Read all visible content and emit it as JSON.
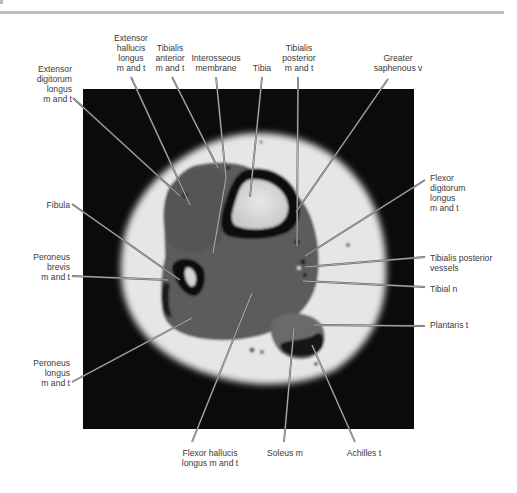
{
  "figure": {
    "type": "axial MRI cross-section of the lower leg (T1-weighted) with anatomical labels",
    "labels": [
      {
        "id": "extensor-digitorum-longus",
        "text": "Extensor\ndigitorum\nlongus\nm and t",
        "x": 72,
        "y": 64,
        "align": "r"
      },
      {
        "id": "extensor-hallucis-longus",
        "text": "Extensor\nhallucis\nlongus\nm and t",
        "x": 131,
        "y": 33,
        "align": "c"
      },
      {
        "id": "tibialis-anterior",
        "text": "Tibialis\nanterior\nm and t",
        "x": 170,
        "y": 43,
        "align": "c"
      },
      {
        "id": "interosseous-membrane",
        "text": "Interosseous\nmembrane",
        "x": 216,
        "y": 53,
        "align": "c"
      },
      {
        "id": "tibia",
        "text": "Tibia",
        "x": 262,
        "y": 63,
        "align": "c"
      },
      {
        "id": "tibialis-posterior",
        "text": "Tibialis\nposterior\nm and t",
        "x": 299,
        "y": 43,
        "align": "c"
      },
      {
        "id": "greater-saphenous-v",
        "text": "Greater\nsaphenous v",
        "x": 398,
        "y": 53,
        "align": "c"
      },
      {
        "id": "flexor-digitorum-longus",
        "text": "Flexor\ndigitorum\nlongus\nm and t",
        "x": 430,
        "y": 173,
        "align": "l"
      },
      {
        "id": "fibula",
        "text": "Fibula",
        "x": 70,
        "y": 200,
        "align": "r"
      },
      {
        "id": "tibialis-posterior-vessels",
        "text": "Tibialis posterior\nvessels",
        "x": 430,
        "y": 253,
        "align": "l"
      },
      {
        "id": "peroneus-brevis",
        "text": "Peroneus\nbrevis\nm and t",
        "x": 70,
        "y": 252,
        "align": "r"
      },
      {
        "id": "tibial-n",
        "text": "Tibial n",
        "x": 430,
        "y": 284,
        "align": "l"
      },
      {
        "id": "plantaris-t",
        "text": "Plantaris t",
        "x": 430,
        "y": 320,
        "align": "l"
      },
      {
        "id": "peroneus-longus",
        "text": "Peroneus\nlongus\nm and t",
        "x": 70,
        "y": 358,
        "align": "r"
      },
      {
        "id": "flexor-hallucis-longus",
        "text": "Flexor hallucis\nlongus m and t",
        "x": 210,
        "y": 448,
        "align": "c"
      },
      {
        "id": "soleus-m",
        "text": "Soleus m",
        "x": 285,
        "y": 448,
        "align": "c"
      },
      {
        "id": "achilles-t",
        "text": "Achilles t",
        "x": 364,
        "y": 448,
        "align": "c"
      }
    ],
    "leaders": [
      {
        "id": "extensor-digitorum-longus",
        "x1": 73,
        "y1": 98,
        "x2": 180,
        "y2": 196
      },
      {
        "id": "extensor-hallucis-longus",
        "x1": 131,
        "y1": 77,
        "x2": 190,
        "y2": 205
      },
      {
        "id": "tibialis-anterior",
        "x1": 172,
        "y1": 77,
        "x2": 218,
        "y2": 168
      },
      {
        "id": "interosseous-membrane",
        "x1": 216,
        "y1": 77,
        "x2": 226,
        "y2": 178
      },
      {
        "id": "interosseous-membrane-b",
        "x1": 226,
        "y1": 178,
        "x2": 213,
        "y2": 253
      },
      {
        "id": "tibia",
        "x1": 262,
        "y1": 77,
        "x2": 250,
        "y2": 197
      },
      {
        "id": "tibialis-posterior",
        "x1": 298,
        "y1": 77,
        "x2": 297,
        "y2": 246
      },
      {
        "id": "greater-saphenous-v",
        "x1": 388,
        "y1": 79,
        "x2": 296,
        "y2": 212
      },
      {
        "id": "flexor-digitorum-longus",
        "x1": 425,
        "y1": 180,
        "x2": 305,
        "y2": 256
      },
      {
        "id": "fibula",
        "x1": 72,
        "y1": 204,
        "x2": 180,
        "y2": 280
      },
      {
        "id": "tibialis-posterior-vessels",
        "x1": 425,
        "y1": 257,
        "x2": 305,
        "y2": 267
      },
      {
        "id": "peroneus-brevis",
        "x1": 72,
        "y1": 276,
        "x2": 168,
        "y2": 280
      },
      {
        "id": "tibial-n",
        "x1": 425,
        "y1": 287,
        "x2": 303,
        "y2": 281
      },
      {
        "id": "plantaris-t",
        "x1": 425,
        "y1": 326,
        "x2": 314,
        "y2": 325
      },
      {
        "id": "peroneus-longus",
        "x1": 72,
        "y1": 382,
        "x2": 192,
        "y2": 318
      },
      {
        "id": "flexor-hallucis-longus",
        "x1": 192,
        "y1": 442,
        "x2": 252,
        "y2": 293
      },
      {
        "id": "soleus-m",
        "x1": 284,
        "y1": 442,
        "x2": 294,
        "y2": 328
      },
      {
        "id": "achilles-t",
        "x1": 355,
        "y1": 442,
        "x2": 312,
        "y2": 345
      }
    ],
    "colors": {
      "background": "#ffffff",
      "mri_frame": "#0b0b0b",
      "fat": "#e9e9e9",
      "muscle": "#5a5a5a",
      "bone_cortex": "#111111",
      "bone_marrow": "#dcdcdc",
      "leader": "#d8d8d8",
      "text": "#3a3a3a",
      "rule": "#bfbfbf"
    }
  }
}
